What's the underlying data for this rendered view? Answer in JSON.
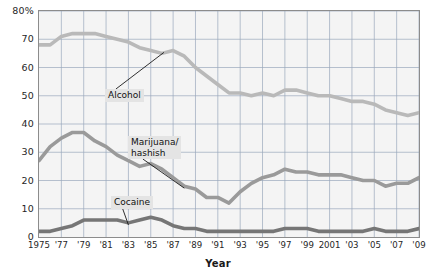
{
  "chart_data": {
    "type": "line",
    "title": "",
    "xlabel": "Year",
    "ylabel": "",
    "xlim": [
      1975,
      2009
    ],
    "ylim": [
      0,
      80
    ],
    "grid": true,
    "legend": "inline-annotations",
    "y_ticks": [
      "0",
      "10",
      "20",
      "30",
      "40",
      "50",
      "60",
      "70",
      "80%"
    ],
    "y_tick_values": [
      0,
      10,
      20,
      30,
      40,
      50,
      60,
      70,
      80
    ],
    "x_tick_labels": [
      "1975",
      "'77",
      "'79",
      "'81",
      "'83",
      "'85",
      "'87",
      "'89",
      "'91",
      "'93",
      "'95",
      "'97",
      "'99",
      "2001",
      "'03",
      "'05",
      "'07",
      "'09"
    ],
    "x_tick_values": [
      1975,
      1977,
      1979,
      1981,
      1983,
      1985,
      1987,
      1989,
      1991,
      1993,
      1995,
      1997,
      1999,
      2001,
      2003,
      2005,
      2007,
      2009
    ],
    "x": [
      1975,
      1976,
      1977,
      1978,
      1979,
      1980,
      1981,
      1982,
      1983,
      1984,
      1985,
      1986,
      1987,
      1988,
      1989,
      1990,
      1991,
      1992,
      1993,
      1994,
      1995,
      1996,
      1997,
      1998,
      1999,
      2000,
      2001,
      2002,
      2003,
      2004,
      2005,
      2006,
      2007,
      2008,
      2009
    ],
    "series": [
      {
        "name": "Alcohol",
        "color": "#b9b9b9",
        "values": [
          68,
          68,
          71,
          72,
          72,
          72,
          71,
          70,
          69,
          67,
          66,
          65,
          66,
          64,
          60,
          57,
          54,
          51,
          51,
          50,
          51,
          50,
          52,
          52,
          51,
          50,
          50,
          49,
          48,
          48,
          47,
          45,
          44,
          43,
          44
        ]
      },
      {
        "name": "Marijuana/hashish",
        "color": "#9a9a9a",
        "values": [
          27,
          32,
          35,
          37,
          37,
          34,
          32,
          29,
          27,
          25,
          26,
          24,
          21,
          18,
          17,
          14,
          14,
          12,
          16,
          19,
          21,
          22,
          24,
          23,
          23,
          22,
          22,
          22,
          21,
          20,
          20,
          18,
          19,
          19,
          21
        ]
      },
      {
        "name": "Cocaine",
        "color": "#767676",
        "values": [
          2,
          2,
          3,
          4,
          6,
          6,
          6,
          6,
          5,
          6,
          7,
          6,
          4,
          3,
          3,
          2,
          2,
          2,
          2,
          2,
          2,
          2,
          3,
          3,
          3,
          2,
          2,
          2,
          2,
          2,
          3,
          2,
          2,
          2,
          3
        ]
      }
    ],
    "annotations": [
      {
        "label": "Alcohol",
        "series": "Alcohol"
      },
      {
        "label": "Marijuana/\nhashish",
        "series": "Marijuana/hashish"
      },
      {
        "label": "Cocaine",
        "series": "Cocaine"
      }
    ]
  },
  "colors": {
    "plot_background": "#f4f4f4",
    "grid": "#9aa8bb",
    "axis": "#8c8c8c",
    "text": "#1a1a1a",
    "callout_background": "#e4e4e4"
  }
}
